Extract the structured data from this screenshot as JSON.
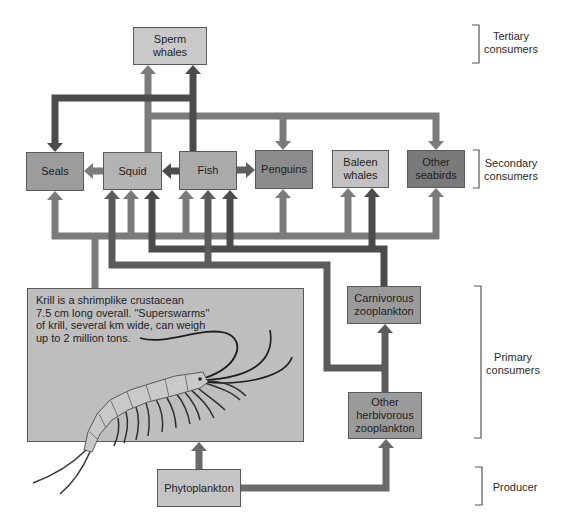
{
  "levels": {
    "tertiary": {
      "lines": [
        "Tertiary",
        "consumers"
      ]
    },
    "secondary": {
      "lines": [
        "Secondary",
        "consumers"
      ]
    },
    "primary": {
      "lines": [
        "Primary",
        "consumers"
      ]
    },
    "producer": {
      "lines": [
        "Producer"
      ]
    }
  },
  "nodes": {
    "sperm_whales": {
      "lines": [
        "Sperm",
        "whales"
      ],
      "level": "tertiary",
      "fill": "#c9c9c9"
    },
    "seals": {
      "lines": [
        "Seals"
      ],
      "level": "secondary",
      "fill": "#9c9c9c"
    },
    "squid": {
      "lines": [
        "Squid"
      ],
      "level": "secondary",
      "fill": "#b3b3b3"
    },
    "fish": {
      "lines": [
        "Fish"
      ],
      "level": "secondary",
      "fill": "#aaaaaa"
    },
    "penguins": {
      "lines": [
        "Penguins"
      ],
      "level": "secondary",
      "fill": "#8c8c8c"
    },
    "baleen_whales": {
      "lines": [
        "Baleen",
        "whales"
      ],
      "level": "secondary",
      "fill": "#c2c2c2"
    },
    "other_seabirds": {
      "lines": [
        "Other",
        "seabirds"
      ],
      "level": "secondary",
      "fill": "#7a7a7a"
    },
    "krill": {
      "level": "primary",
      "fill": "#bebebe",
      "note_lines": [
        "Krill is a shrimplike crustacean",
        "7.5 cm long overall. \"Superswarms\"",
        "of krill, several km wide, can weigh",
        "up to 2 million tons."
      ]
    },
    "carnivorous_zooplankton": {
      "lines": [
        "Carnivorous",
        "zooplankton"
      ],
      "level": "primary",
      "fill": "#9a9a9a"
    },
    "other_herbivorous_zooplankton": {
      "lines": [
        "Other",
        "herbivorous",
        "zooplankton"
      ],
      "level": "primary",
      "fill": "#9a9a9a"
    },
    "phytoplankton": {
      "lines": [
        "Phytoplankton"
      ],
      "level": "producer",
      "fill": "#c4c4c4"
    }
  },
  "edges": [
    {
      "from": "squid",
      "to": "sperm_whales"
    },
    {
      "from": "fish",
      "to": "sperm_whales"
    },
    {
      "from": "fish",
      "to": "seals"
    },
    {
      "from": "squid",
      "to": "penguins"
    },
    {
      "from": "squid",
      "to": "other_seabirds"
    },
    {
      "from": "squid",
      "to": "seals"
    },
    {
      "from": "fish",
      "to": "squid"
    },
    {
      "from": "fish",
      "to": "penguins"
    },
    {
      "from": "krill",
      "to": "seals"
    },
    {
      "from": "krill",
      "to": "squid"
    },
    {
      "from": "krill",
      "to": "fish"
    },
    {
      "from": "krill",
      "to": "penguins"
    },
    {
      "from": "krill",
      "to": "baleen_whales"
    },
    {
      "from": "krill",
      "to": "other_seabirds"
    },
    {
      "from": "carnivorous_zooplankton",
      "to": "squid"
    },
    {
      "from": "carnivorous_zooplankton",
      "to": "fish"
    },
    {
      "from": "carnivorous_zooplankton",
      "to": "baleen_whales"
    },
    {
      "from": "other_herbivorous_zooplankton",
      "to": "squid"
    },
    {
      "from": "other_herbivorous_zooplankton",
      "to": "fish"
    },
    {
      "from": "other_herbivorous_zooplankton",
      "to": "carnivorous_zooplankton"
    },
    {
      "from": "phytoplankton",
      "to": "krill"
    },
    {
      "from": "phytoplankton",
      "to": "other_herbivorous_zooplankton"
    }
  ],
  "colors": {
    "arrow_medium": "#7b7b7b",
    "arrow_dark": "#4b4b4b",
    "arrow_herbivore": "#5c5c5c",
    "arrow_phytoplankton": "#6a6a6a",
    "box_border": "#5a5a5a",
    "bracket": "#555555"
  }
}
